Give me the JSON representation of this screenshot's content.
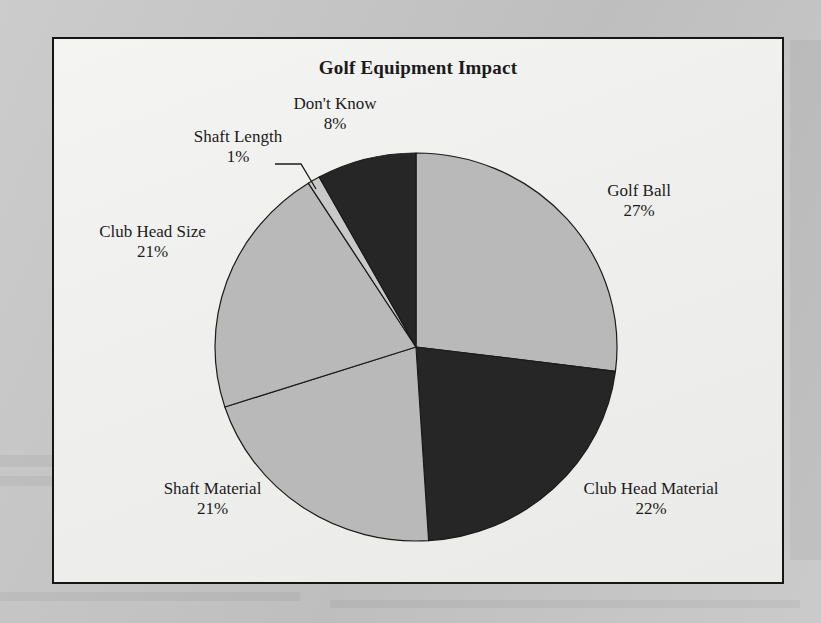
{
  "figure": {
    "title": "Golf Equipment Impact",
    "frame_color": "#161616",
    "background_color": "#f1f1ef",
    "page_color": "#c6c6c6"
  },
  "chart_data": {
    "type": "pie",
    "title": "Golf Equipment Impact",
    "xlabel": "",
    "ylabel": "",
    "legend": "none",
    "labels_position": "outside-with-leader-lines",
    "start_angle_deg": 0,
    "direction": "clockwise",
    "categories": [
      "Golf Ball",
      "Club Head Material",
      "Shaft Material",
      "Club Head Size",
      "Shaft Length",
      "Don't Know"
    ],
    "values": [
      27,
      22,
      21,
      21,
      1,
      8
    ],
    "value_suffix": "%",
    "total": 100,
    "slices": [
      {
        "name": "Golf Ball",
        "value": 27,
        "value_text": "27%",
        "color": "#b9b9b9",
        "start_deg": 0,
        "end_deg": 97.2
      },
      {
        "name": "Club Head Material",
        "value": 22,
        "value_text": "22%",
        "color": "#262626",
        "start_deg": 97.2,
        "end_deg": 176.4
      },
      {
        "name": "Shaft Material",
        "value": 21,
        "value_text": "21%",
        "color": "#b9b9b9",
        "start_deg": 176.4,
        "end_deg": 252.0
      },
      {
        "name": "Club Head Size",
        "value": 21,
        "value_text": "21%",
        "color": "#b9b9b9",
        "start_deg": 252.0,
        "end_deg": 327.6
      },
      {
        "name": "Shaft Length",
        "value": 1,
        "value_text": "1%",
        "color": "#c9c9c9",
        "start_deg": 327.6,
        "end_deg": 331.2
      },
      {
        "name": "Don't Know",
        "value": 8,
        "value_text": "8%",
        "color": "#262626",
        "start_deg": 331.2,
        "end_deg": 360.0
      }
    ]
  },
  "labels": {
    "dont_know": {
      "name": "Don't Know",
      "value": "8%"
    },
    "shaft_length": {
      "name": "Shaft Length",
      "value": "1%"
    },
    "golf_ball": {
      "name": "Golf Ball",
      "value": "27%"
    },
    "club_head_size": {
      "name": "Club Head Size",
      "value": "21%"
    },
    "shaft_material": {
      "name": "Shaft Material",
      "value": "21%"
    },
    "club_head_material": {
      "name": "Club Head Material",
      "value": "22%"
    }
  }
}
